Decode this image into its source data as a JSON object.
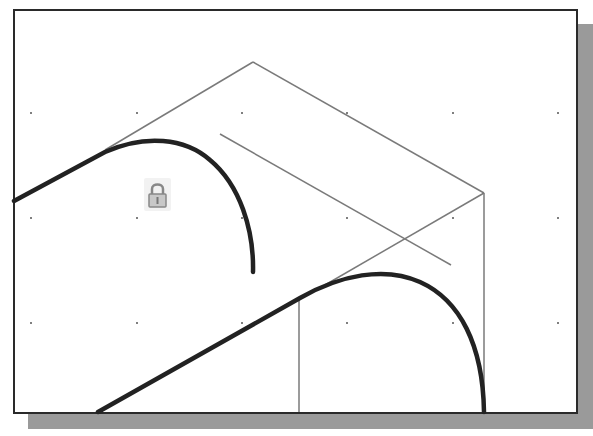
{
  "viewport": {
    "background": "#ffffff",
    "border_color": "#2a2a2a",
    "shadow_color": "#9a9a9a"
  },
  "grid": {
    "x": [
      31,
      137,
      242,
      347,
      453,
      558
    ],
    "y": [
      113,
      218,
      323
    ],
    "dot_color": "#555555"
  },
  "constraint": {
    "icon": "lock-icon",
    "x": 158,
    "y": 195
  },
  "construction_lines": {
    "color": "#7a7a7a",
    "width": 1.5,
    "segments": [
      [
        [
          105,
          150
        ],
        [
          253,
          62
        ]
      ],
      [
        [
          253,
          62
        ],
        [
          484,
          193
        ]
      ],
      [
        [
          220,
          134
        ],
        [
          451,
          265
        ]
      ],
      [
        [
          484,
          193
        ],
        [
          325,
          285
        ]
      ],
      [
        [
          484,
          193
        ],
        [
          484,
          412
        ]
      ],
      [
        [
          299,
          298
        ],
        [
          299,
          412
        ]
      ]
    ]
  },
  "object_lines": {
    "color": "#222222",
    "width": 4.5
  }
}
